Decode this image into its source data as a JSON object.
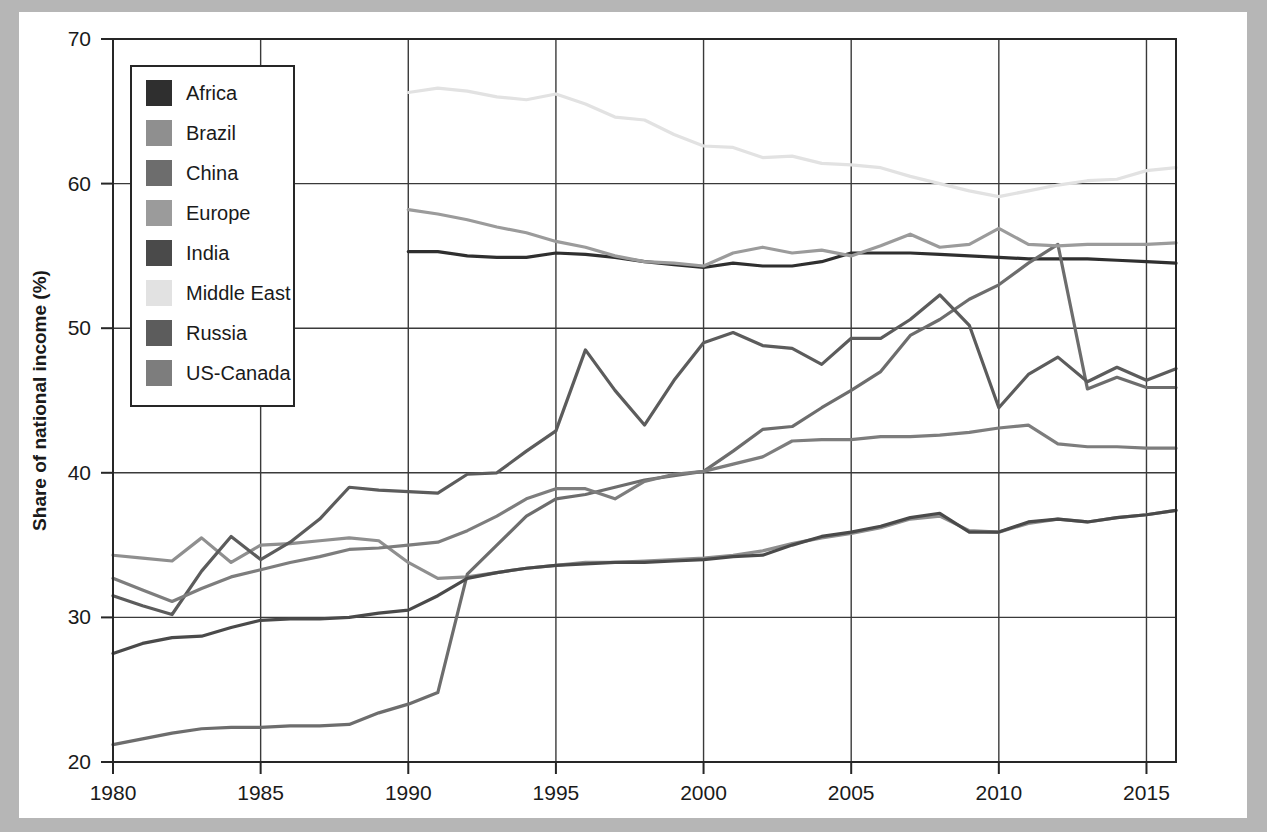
{
  "figure": {
    "background_color": "#b6b6b6",
    "sheet_color": "#ffffff",
    "axis_color": "#262626",
    "grid_color": "#3a3a3a"
  },
  "chart_data": {
    "type": "line",
    "title": "",
    "xlabel": "",
    "ylabel": "Share of national income (%)",
    "xlim": [
      1980,
      2016
    ],
    "ylim": [
      20,
      70
    ],
    "xticks": [
      1980,
      1985,
      1990,
      1995,
      2000,
      2005,
      2010,
      2015
    ],
    "yticks": [
      20,
      30,
      40,
      50,
      60,
      70
    ],
    "xtick_labels": [
      "1980",
      "1985",
      "1990",
      "1995",
      "2000",
      "2005",
      "2010",
      "2015"
    ],
    "ytick_labels": [
      "20",
      "30",
      "40",
      "50",
      "60",
      "70"
    ],
    "grid": true,
    "legend_position": "upper-left",
    "series": [
      {
        "name": "Africa",
        "color": "#2f2f2f",
        "x": [
          1990,
          1991,
          1992,
          1993,
          1994,
          1995,
          1996,
          1997,
          1998,
          1999,
          2000,
          2001,
          2002,
          2003,
          2004,
          2005,
          2006,
          2007,
          2008,
          2009,
          2010,
          2011,
          2012,
          2013,
          2014,
          2015,
          2016
        ],
        "values": [
          55.3,
          55.3,
          55.0,
          54.9,
          54.9,
          55.2,
          55.1,
          54.9,
          54.6,
          54.4,
          54.2,
          54.5,
          54.3,
          54.3,
          54.6,
          55.2,
          55.2,
          55.2,
          55.1,
          55.0,
          54.9,
          54.8,
          54.8,
          54.8,
          54.7,
          54.6,
          54.5
        ]
      },
      {
        "name": "Brazil",
        "color": "#8f8f8f",
        "x": [
          1980,
          1981,
          1982,
          1983,
          1984,
          1985,
          1986,
          1987,
          1988,
          1989,
          1990,
          1991,
          1992,
          1993,
          1994,
          1995,
          1996,
          1997,
          1998,
          1999,
          2000,
          2001,
          2002,
          2003,
          2004,
          2005,
          2006,
          2007,
          2008,
          2009,
          2010,
          2011,
          2012,
          2013,
          2014,
          2015,
          2016
        ],
        "values": [
          34.3,
          34.1,
          33.9,
          35.5,
          33.8,
          35.0,
          35.1,
          35.3,
          35.5,
          35.3,
          33.8,
          32.7,
          32.8,
          33.1,
          33.4,
          33.6,
          33.8,
          33.8,
          33.9,
          34.0,
          34.1,
          34.3,
          34.6,
          35.1,
          35.5,
          35.8,
          36.2,
          36.8,
          37.0,
          36.0,
          35.9,
          36.5,
          36.8,
          36.6,
          36.9,
          37.1,
          37.4
        ]
      },
      {
        "name": "China",
        "color": "#6d6d6d",
        "x": [
          1980,
          1981,
          1982,
          1983,
          1984,
          1985,
          1986,
          1987,
          1988,
          1989,
          1990,
          1991,
          1992,
          1993,
          1994,
          1995,
          1996,
          1997,
          1998,
          1999,
          2000,
          2001,
          2002,
          2003,
          2004,
          2005,
          2006,
          2007,
          2008,
          2009,
          2010,
          2011,
          2012,
          2013,
          2014,
          2015,
          2016
        ],
        "values": [
          21.2,
          21.6,
          22.0,
          22.3,
          22.4,
          22.4,
          22.5,
          22.5,
          22.6,
          23.4,
          24.0,
          24.8,
          33.0,
          35.0,
          37.0,
          38.2,
          38.5,
          39.0,
          39.5,
          39.8,
          40.1,
          41.5,
          43.0,
          43.2,
          44.5,
          45.7,
          47.0,
          49.5,
          50.6,
          52.0,
          53.0,
          54.5,
          55.8,
          45.8,
          46.6,
          45.9,
          45.9
        ]
      },
      {
        "name": "Europe",
        "color": "#9b9b9b",
        "x": [
          1990,
          1991,
          1992,
          1993,
          1994,
          1995,
          1996,
          1997,
          1998,
          1999,
          2000,
          2001,
          2002,
          2003,
          2004,
          2005,
          2006,
          2007,
          2008,
          2009,
          2010,
          2011,
          2012,
          2013,
          2014,
          2015,
          2016
        ],
        "values": [
          58.2,
          57.9,
          57.5,
          57.0,
          56.6,
          56.0,
          55.6,
          55.0,
          54.6,
          54.5,
          54.3,
          55.2,
          55.6,
          55.2,
          55.4,
          55.0,
          55.7,
          56.5,
          55.6,
          55.8,
          56.9,
          55.8,
          55.7,
          55.8,
          55.8,
          55.8,
          55.9
        ]
      },
      {
        "name": "India",
        "color": "#4a4a4a",
        "x": [
          1980,
          1981,
          1982,
          1983,
          1984,
          1985,
          1986,
          1987,
          1988,
          1989,
          1990,
          1991,
          1992,
          1993,
          1994,
          1995,
          1996,
          1997,
          1998,
          1999,
          2000,
          2001,
          2002,
          2003,
          2004,
          2005,
          2006,
          2007,
          2008,
          2009,
          2010,
          2011,
          2012,
          2013,
          2014,
          2015,
          2016
        ],
        "values": [
          27.5,
          28.2,
          28.6,
          28.7,
          29.3,
          29.8,
          29.9,
          29.9,
          30.0,
          30.3,
          30.5,
          31.5,
          32.7,
          33.1,
          33.4,
          33.6,
          33.7,
          33.8,
          33.8,
          33.9,
          34.0,
          34.2,
          34.3,
          35.0,
          35.6,
          35.9,
          36.3,
          36.9,
          37.2,
          35.9,
          35.9,
          36.6,
          36.8,
          36.6,
          36.9,
          37.1,
          37.4
        ]
      },
      {
        "name": "Middle East",
        "color": "#e2e2e2",
        "x": [
          1990,
          1991,
          1992,
          1993,
          1994,
          1995,
          1996,
          1997,
          1998,
          1999,
          2000,
          2001,
          2002,
          2003,
          2004,
          2005,
          2006,
          2007,
          2008,
          2009,
          2010,
          2011,
          2012,
          2013,
          2014,
          2015,
          2016
        ],
        "values": [
          66.3,
          66.6,
          66.4,
          66.0,
          65.8,
          66.2,
          65.5,
          64.6,
          64.4,
          63.4,
          62.6,
          62.5,
          61.8,
          61.9,
          61.4,
          61.3,
          61.1,
          60.5,
          60.0,
          59.5,
          59.1,
          59.5,
          59.9,
          60.2,
          60.3,
          60.9,
          61.1
        ]
      },
      {
        "name": "Russia",
        "color": "#5c5c5c",
        "x": [
          1980,
          1981,
          1982,
          1983,
          1984,
          1985,
          1986,
          1987,
          1988,
          1989,
          1990,
          1991,
          1992,
          1993,
          1994,
          1995,
          1996,
          1997,
          1998,
          1999,
          2000,
          2001,
          2002,
          2003,
          2004,
          2005,
          2006,
          2007,
          2008,
          2009,
          2010,
          2011,
          2012,
          2013,
          2014,
          2015,
          2016
        ],
        "values": [
          31.5,
          30.8,
          30.2,
          33.2,
          35.6,
          34.0,
          35.2,
          36.8,
          39.0,
          38.8,
          38.7,
          38.6,
          39.9,
          40.0,
          41.5,
          42.9,
          48.5,
          45.7,
          43.3,
          46.4,
          49.0,
          49.7,
          48.8,
          48.6,
          47.5,
          49.3,
          49.3,
          50.6,
          52.3,
          50.2,
          44.5,
          46.8,
          48.0,
          46.3,
          47.3,
          46.4,
          47.2
        ]
      },
      {
        "name": "US-Canada",
        "color": "#7d7d7d",
        "x": [
          1980,
          1981,
          1982,
          1983,
          1984,
          1985,
          1986,
          1987,
          1988,
          1989,
          1990,
          1991,
          1992,
          1993,
          1994,
          1995,
          1996,
          1997,
          1998,
          1999,
          2000,
          2001,
          2002,
          2003,
          2004,
          2005,
          2006,
          2007,
          2008,
          2009,
          2010,
          2011,
          2012,
          2013,
          2014,
          2015,
          2016
        ],
        "values": [
          32.7,
          31.9,
          31.1,
          32.0,
          32.8,
          33.3,
          33.8,
          34.2,
          34.7,
          34.8,
          35.0,
          35.2,
          36.0,
          37.0,
          38.2,
          38.9,
          38.9,
          38.2,
          39.4,
          39.9,
          40.1,
          40.6,
          41.1,
          42.2,
          42.3,
          42.3,
          42.5,
          42.5,
          42.6,
          42.8,
          43.1,
          43.3,
          42.0,
          41.8,
          41.8,
          41.7,
          41.7
        ]
      }
    ]
  },
  "legend": {
    "items": [
      {
        "label": "Africa",
        "color": "#2f2f2f"
      },
      {
        "label": "Brazil",
        "color": "#8f8f8f"
      },
      {
        "label": "China",
        "color": "#6d6d6d"
      },
      {
        "label": "Europe",
        "color": "#9b9b9b"
      },
      {
        "label": "India",
        "color": "#4a4a4a"
      },
      {
        "label": "Middle East",
        "color": "#e2e2e2"
      },
      {
        "label": "Russia",
        "color": "#5c5c5c"
      },
      {
        "label": "US-Canada",
        "color": "#7d7d7d"
      }
    ]
  }
}
